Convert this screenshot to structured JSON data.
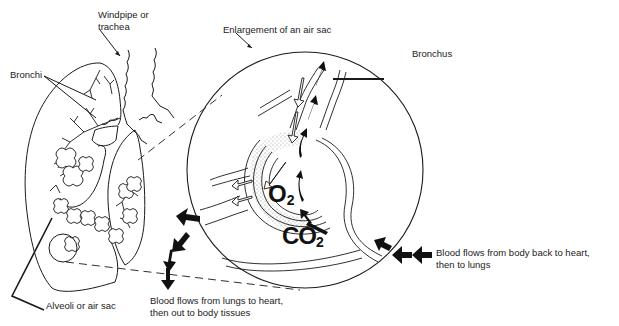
{
  "diagram": {
    "type": "anatomy-illustration",
    "labels": {
      "windpipe": "Windpipe or\ntrachea",
      "windpipe_line1": "Windpipe or",
      "windpipe_line2": "trachea",
      "bronchi": "Bronchi",
      "enlargement": "Enlargement of an air sac",
      "bronchus": "Bronchus",
      "alveoli": "Alveoli or air sac",
      "blood_out_line1": "Blood flows from lungs to heart,",
      "blood_out_line2": "then out to body tissues",
      "blood_in_line1": "Blood flows from body back to heart,",
      "blood_in_line2": "then to lungs"
    },
    "gases": {
      "oxygen_symbol": "O",
      "oxygen_subscript": "2",
      "co2_symbol": "CO",
      "co2_subscript": "2"
    },
    "colors": {
      "line": "#1a1a1a",
      "stipple": "#bdbdbd",
      "background": "#ffffff"
    }
  }
}
